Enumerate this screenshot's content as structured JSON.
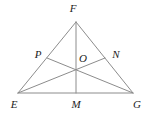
{
  "figure": {
    "kind": "geometry-diagram",
    "width": 146,
    "height": 113,
    "background_color": "#ffffff",
    "stroke_color": "#8c8c8c",
    "label_color": "#1c1c1c",
    "stroke_width": 1
  },
  "points": [
    {
      "id": "F",
      "label": "F",
      "role": "apex-vertex",
      "x": 76,
      "y": 22,
      "label_x": 73,
      "label_y": 8
    },
    {
      "id": "E",
      "label": "E",
      "role": "bottom-left-vertex",
      "x": 18,
      "y": 93,
      "label_x": 14,
      "label_y": 104
    },
    {
      "id": "G",
      "label": "G",
      "role": "bottom-right-vertex",
      "x": 133,
      "y": 93,
      "label_x": 137,
      "label_y": 104
    },
    {
      "id": "M",
      "label": "M",
      "role": "midpoint-of-EG",
      "x": 76,
      "y": 93,
      "label_x": 76,
      "label_y": 104
    },
    {
      "id": "P",
      "label": "P",
      "role": "midpoint-of-EF",
      "x": 47,
      "y": 58,
      "label_x": 38,
      "label_y": 54
    },
    {
      "id": "N",
      "label": "N",
      "role": "midpoint-of-FG",
      "x": 105,
      "y": 58,
      "label_x": 116,
      "label_y": 54
    },
    {
      "id": "O",
      "label": "O",
      "role": "centroid",
      "x": 76,
      "y": 69,
      "label_x": 83,
      "label_y": 58
    }
  ],
  "segments": [
    {
      "id": "EF",
      "from": "E",
      "to": "F",
      "role": "triangle-side-left"
    },
    {
      "id": "FG",
      "from": "F",
      "to": "G",
      "role": "triangle-side-right"
    },
    {
      "id": "EG",
      "from": "E",
      "to": "G",
      "role": "triangle-side-base"
    },
    {
      "id": "FM",
      "from": "F",
      "to": "M",
      "role": "median-from-F"
    },
    {
      "id": "EN",
      "from": "E",
      "to": "N",
      "role": "median-from-E"
    },
    {
      "id": "GP",
      "from": "G",
      "to": "P",
      "role": "median-from-G"
    }
  ]
}
